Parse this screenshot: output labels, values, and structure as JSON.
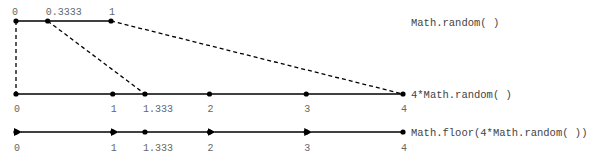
{
  "rows": [
    {
      "id": "math-random",
      "label": "Math.random( )",
      "points": [
        {
          "value": 0,
          "label": "0"
        },
        {
          "value": 0.3333,
          "label": "0.3333"
        },
        {
          "value": 1,
          "label": "1"
        }
      ]
    },
    {
      "id": "scaled",
      "label": "4*Math.random( )",
      "points": [
        {
          "value": 0,
          "label": "0"
        },
        {
          "value": 1,
          "label": "1"
        },
        {
          "value": 1.333,
          "label": "1.333"
        },
        {
          "value": 2,
          "label": "2"
        },
        {
          "value": 3,
          "label": "3"
        },
        {
          "value": 4,
          "label": "4"
        }
      ]
    },
    {
      "id": "floored",
      "label": "Math.floor(4*Math.random( ))",
      "points": [
        {
          "value": 0,
          "label": "0"
        },
        {
          "value": 1,
          "label": "1"
        },
        {
          "value": 1.333,
          "label": "1.333"
        },
        {
          "value": 2,
          "label": "2"
        },
        {
          "value": 3,
          "label": "3"
        },
        {
          "value": 4,
          "label": "4"
        }
      ]
    }
  ],
  "mappings": [
    {
      "from": 0,
      "to": 0
    },
    {
      "from": 0.3333,
      "to": 1.333
    },
    {
      "from": 1,
      "to": 4
    }
  ],
  "floor_arrows": [
    {
      "from": 1,
      "to": 0
    },
    {
      "from": 2,
      "to": 1
    },
    {
      "from": 3,
      "to": 2
    },
    {
      "from": 4,
      "to": 3
    }
  ]
}
